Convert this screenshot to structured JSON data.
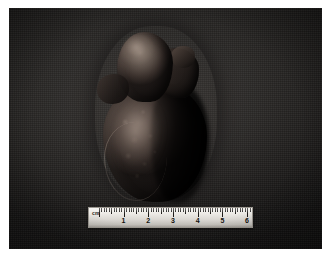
{
  "page": {
    "background_color": "#ffffff",
    "width": 334,
    "height": 258
  },
  "photograph": {
    "label": "gross-specimen-photograph",
    "background_color": "#2b2927",
    "shadow_color": "#141211",
    "subject": "Heart specimen, anterior view, apex directed inferiorly",
    "alt_text": "Dark gross pathology photograph of an excised heart on a dark cloth background with a centimeter ruler below"
  },
  "specimen": {
    "name": "heart",
    "orientation": "apex-down",
    "parts": [
      {
        "name": "ventricular-mass",
        "tone": "#4a403b"
      },
      {
        "name": "atrial-appendage-base",
        "tone": "#564a43"
      },
      {
        "name": "great-vessel-stump",
        "tone": "#4a3e38"
      },
      {
        "name": "left-appendage-nub",
        "tone": "#40342f"
      }
    ],
    "highlight_color": "#ac9a8e",
    "shadow_color": "#0a0807"
  },
  "ruler": {
    "name": "centimeter-ruler",
    "unit_label": "cm",
    "body_color": "#e6e3de",
    "tick_color": "#1d1b19",
    "major_numbers": [
      1,
      2,
      3,
      4,
      5,
      6
    ],
    "minor_divisions_per_cm": 10,
    "range_cm": [
      0,
      6.6
    ],
    "total_centimeters": 6.6
  }
}
